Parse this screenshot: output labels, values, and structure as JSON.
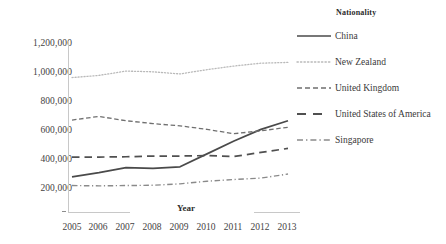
{
  "chart_data": {
    "type": "line",
    "title": "",
    "xlabel": "Year",
    "ylabel": "",
    "legend_title": "Nationality",
    "legend_position": "right",
    "grid": false,
    "categories": [
      "2005",
      "2006",
      "2007",
      "2008",
      "2009",
      "2010",
      "2011",
      "2012",
      "2013"
    ],
    "x": [
      2005,
      2006,
      2007,
      2008,
      2009,
      2010,
      2011,
      2012,
      2013
    ],
    "ylim": [
      0,
      1200000
    ],
    "yticks": [
      200000,
      400000,
      600000,
      800000,
      1000000,
      1200000
    ],
    "ytick_labels": [
      "200,000",
      "400,000",
      "600,000",
      "800,000",
      "1,000,000",
      "1,200,000"
    ],
    "series": [
      {
        "name": "China",
        "style": "solid",
        "color": "#4a4a4a",
        "values": [
          270000,
          300000,
          335000,
          330000,
          340000,
          430000,
          520000,
          600000,
          660000
        ]
      },
      {
        "name": "New Zealand",
        "style": "dotted",
        "color": "#b9b9b9",
        "values": [
          960000,
          975000,
          1005000,
          1000000,
          985000,
          1015000,
          1040000,
          1060000,
          1065000
        ]
      },
      {
        "name": "United Kingdom",
        "style": "dashed",
        "color": "#6f6f6f",
        "values": [
          665000,
          690000,
          660000,
          640000,
          625000,
          600000,
          570000,
          590000,
          615000
        ]
      },
      {
        "name": "United States of America",
        "style": "long-dash",
        "color": "#505050",
        "values": [
          408000,
          408000,
          410000,
          415000,
          415000,
          418000,
          412000,
          440000,
          468000
        ]
      },
      {
        "name": "Singapore",
        "style": "dash-dot",
        "color": "#8a8a8a",
        "values": [
          210000,
          208000,
          210000,
          212000,
          222000,
          240000,
          252000,
          262000,
          290000
        ]
      }
    ]
  },
  "axis": {
    "x_title": "Year"
  },
  "legend": {
    "title": "Nationality",
    "items": [
      {
        "label": "China",
        "style": "solid"
      },
      {
        "label": "New Zealand",
        "style": "dotted"
      },
      {
        "label": "United Kingdom",
        "style": "dashed"
      },
      {
        "label": "United States of America",
        "style": "long-dash"
      },
      {
        "label": "Singapore",
        "style": "dash-dot"
      }
    ]
  }
}
